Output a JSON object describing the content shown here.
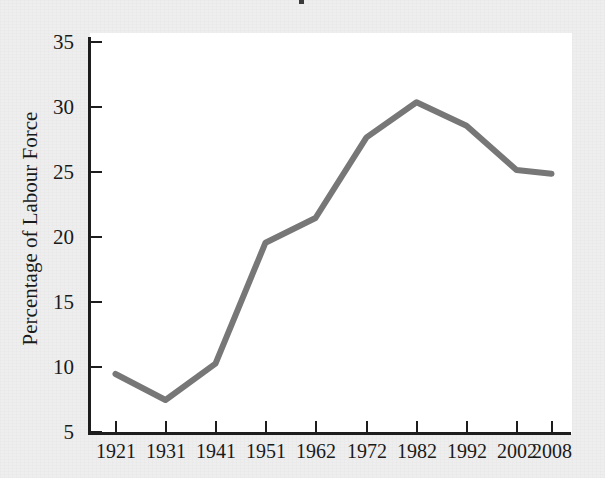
{
  "chart_data": {
    "type": "line",
    "title": "",
    "xlabel": "",
    "ylabel": "Percentage of Labour Force",
    "categories": [
      "1921",
      "1931",
      "1941",
      "1951",
      "1962",
      "1972",
      "1982",
      "1992",
      "2002",
      "2008"
    ],
    "values": [
      9.5,
      7.5,
      10.3,
      19.6,
      21.5,
      27.7,
      30.4,
      28.6,
      25.2,
      24.9
    ],
    "series": [
      {
        "name": "Percentage of Labour Force",
        "values": [
          9.5,
          7.5,
          10.3,
          19.6,
          21.5,
          27.7,
          30.4,
          28.6,
          25.2,
          24.9
        ]
      }
    ],
    "ylim": [
      5,
      35
    ],
    "y_ticks": [
      "5",
      "10",
      "15",
      "20",
      "25",
      "30",
      "35"
    ],
    "y_tick_values": [
      5,
      10,
      15,
      20,
      25,
      30,
      35
    ],
    "x_ticks": [
      "1921",
      "1931",
      "1941",
      "1951",
      "1962",
      "1972",
      "1982",
      "1992",
      "2002",
      "2008"
    ],
    "grid": false,
    "legend": false,
    "legend_position": "none",
    "line_color": "#777777",
    "axis_color": "#1d1d1d",
    "plot_background": "#ffffff",
    "figure_background": "#eeeeef"
  },
  "figure": {
    "title_remnant": ","
  }
}
